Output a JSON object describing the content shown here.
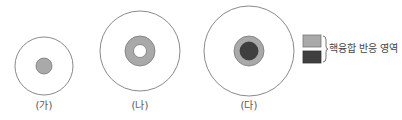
{
  "colors": {
    "outline": "#8a8a8a",
    "fusion_light": "#a9a9a9",
    "fusion_dark": "#3f3f3f",
    "background": "#ffffff",
    "label_text": "#555555"
  },
  "stars": [
    {
      "id": "ga",
      "label": "(가)",
      "cx": 44,
      "cy": 66,
      "outer_r": 29,
      "layers": [
        {
          "r": 8,
          "fill": "fusion_light"
        }
      ]
    },
    {
      "id": "na",
      "label": "(나)",
      "cx": 140,
      "cy": 51,
      "outer_r": 40,
      "layers": [
        {
          "r": 15,
          "fill": "fusion_light"
        },
        {
          "r": 6.5,
          "fill": "background"
        }
      ]
    },
    {
      "id": "da",
      "label": "(다)",
      "cx": 249,
      "cy": 51,
      "outer_r": 45,
      "layers": [
        {
          "r": 15,
          "fill": "fusion_light"
        },
        {
          "r": 9,
          "fill": "fusion_dark"
        }
      ]
    }
  ],
  "legend": {
    "text": "핵융합 반응 영역",
    "swatches": [
      {
        "name": "light-fusion-swatch",
        "fill": "fusion_light"
      },
      {
        "name": "dark-fusion-swatch",
        "fill": "fusion_dark"
      }
    ]
  }
}
